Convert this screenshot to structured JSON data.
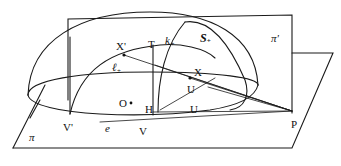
{
  "figure": {
    "type": "geometric-diagram",
    "labels": {
      "vertical_plane": "π'",
      "horizontal_plane": "π",
      "hemisphere": "S",
      "hemisphere_sub": "+",
      "X_prime": "X'",
      "T": "T",
      "k_plus": "k",
      "k_sub": "+",
      "ell_plus": "ℓ",
      "ell_sub": "+",
      "X": "X",
      "O": "O",
      "H": "H",
      "U_upper": "U",
      "U_lower": "U",
      "V_prime": "V'",
      "e": "e",
      "V": "V",
      "P": "P"
    }
  }
}
